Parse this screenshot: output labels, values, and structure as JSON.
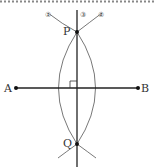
{
  "diagram": {
    "points": {
      "A": {
        "label": "A",
        "x": 16,
        "y": 88
      },
      "B": {
        "label": "B",
        "x": 138,
        "y": 88
      },
      "P": {
        "label": "P",
        "x": 77,
        "y": 32
      },
      "Q": {
        "label": "Q",
        "x": 77,
        "y": 144
      }
    },
    "markers": {
      "arc1": "①",
      "line3": "③",
      "arc2": "②"
    },
    "right_angle_mark": true,
    "colors": {
      "line": "#222222",
      "arc": "#555555",
      "dotted_border": "#888888"
    }
  }
}
